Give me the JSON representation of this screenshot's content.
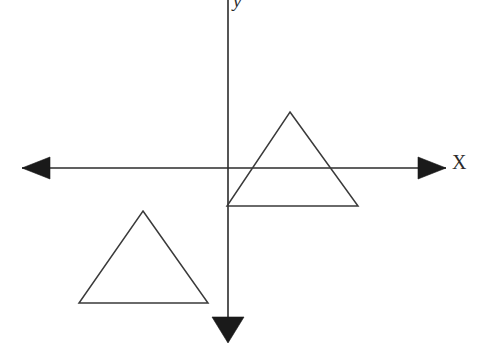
{
  "figure": {
    "name": "coordinate-plane-triangle-translation",
    "width": 479,
    "height": 349,
    "background_color": "#ffffff",
    "ink_color": "#2b2b2b"
  },
  "axes": {
    "x_axis": {
      "label": "X",
      "orientation": "horizontal",
      "y_position": 168,
      "start_x": 22,
      "end_x": 446,
      "arrow_left": true,
      "arrow_right": true
    },
    "y_axis": {
      "label": "y",
      "orientation": "vertical",
      "x_position": 228,
      "start_y": 0,
      "end_y": 328,
      "arrow_up": false,
      "arrow_down": true
    },
    "origin": {
      "x": 228,
      "y": 168
    }
  },
  "shapes": [
    {
      "name": "upper-right-triangle",
      "type": "triangle",
      "description": "image triangle straddling the x-axis, left vertex on the y-axis",
      "points": "290,112 358,206 227,206",
      "vertices": [
        {
          "x": 290,
          "y": 112
        },
        {
          "x": 358,
          "y": 206
        },
        {
          "x": 227,
          "y": 206
        }
      ]
    },
    {
      "name": "lower-left-triangle",
      "type": "triangle",
      "description": "pre-image triangle in the third quadrant",
      "points": "143,211 208,303 79,303",
      "vertices": [
        {
          "x": 143,
          "y": 211
        },
        {
          "x": 208,
          "y": 303
        },
        {
          "x": 79,
          "y": 303
        }
      ]
    }
  ],
  "arrowheads": [
    {
      "name": "x-axis-left-arrowhead",
      "points": "22,168 50,157 50,179"
    },
    {
      "name": "x-axis-right-arrowhead",
      "points": "446,168 418,157 418,179"
    },
    {
      "name": "y-axis-down-arrowhead",
      "points": "228,343 212,317 244,317"
    }
  ]
}
